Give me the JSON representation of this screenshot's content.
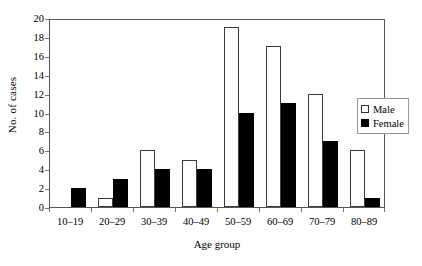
{
  "chart_data": {
    "type": "bar",
    "title": "",
    "xlabel": "Age group",
    "ylabel": "No. of cases",
    "categories": [
      "10–19",
      "20–29",
      "30–39",
      "40–49",
      "50–59",
      "60–69",
      "70–79",
      "80–89"
    ],
    "series": [
      {
        "name": "Male",
        "color": "#ffffff",
        "values": [
          0,
          1,
          6,
          5,
          19,
          17,
          12,
          6
        ]
      },
      {
        "name": "Female",
        "color": "#000000",
        "values": [
          2,
          3,
          4,
          4,
          10,
          11,
          7,
          1
        ]
      }
    ],
    "ylim": [
      0,
      20
    ],
    "yticks": [
      0,
      2,
      4,
      6,
      8,
      10,
      12,
      14,
      16,
      18,
      20
    ],
    "ytick_labels": [
      "0",
      "2",
      "4",
      "6",
      "8",
      "10",
      "12",
      "14",
      "16",
      "18",
      "20"
    ],
    "grid": false,
    "legend_position": "right"
  },
  "legend": {
    "items": [
      {
        "label": "Male",
        "swatch": "open-square-icon"
      },
      {
        "label": "Female",
        "swatch": "filled-square-icon"
      }
    ]
  }
}
